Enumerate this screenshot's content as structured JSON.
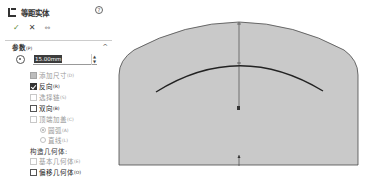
{
  "panel": {
    "title": "等距实体",
    "title_icon": "offset-entities-icon",
    "help_icon": "help-icon",
    "actions": {
      "ok": "✓",
      "cancel": "✕",
      "pin": "⇔"
    },
    "section": {
      "label": "参数",
      "shortcut": "(P)",
      "collapse_glyph": "^"
    },
    "offset_distance": {
      "value": "15.00mm",
      "spinner_up": "▲",
      "spinner_down": "▼"
    },
    "options": [
      {
        "label": "添加尺寸",
        "shortcut": "(D)",
        "state": "mixed",
        "enabled": false
      },
      {
        "label": "反向",
        "shortcut": "(R)",
        "state": "checked",
        "enabled": true
      },
      {
        "label": "选择链",
        "shortcut": "(S)",
        "state": "unchecked",
        "enabled": false
      },
      {
        "label": "双向",
        "shortcut": "(B)",
        "state": "unchecked",
        "enabled": true
      },
      {
        "label": "顶端加盖",
        "shortcut": "(C)",
        "state": "unchecked",
        "enabled": false
      }
    ],
    "cap_options": [
      {
        "label": "圆弧",
        "shortcut": "(A)",
        "selected": true,
        "enabled": false
      },
      {
        "label": "直线",
        "shortcut": "(L)",
        "selected": false,
        "enabled": false
      }
    ],
    "construction_label": "构造几何体:",
    "construction_options": [
      {
        "label": "基本几何体",
        "shortcut": "(E)",
        "state": "unchecked",
        "enabled": false
      },
      {
        "label": "偏移几何体",
        "shortcut": "(O)",
        "state": "unchecked",
        "enabled": true
      }
    ]
  },
  "canvas": {
    "fill_color": "#c8c8c8",
    "stroke_color": "#444444",
    "arc_color": "#222222"
  }
}
